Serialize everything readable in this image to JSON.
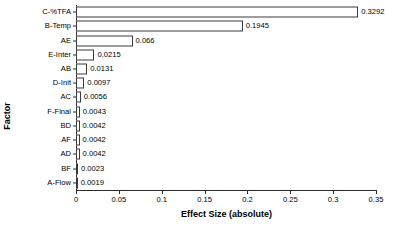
{
  "chart_data": {
    "type": "bar",
    "orientation": "horizontal",
    "title": "",
    "xlabel": "Effect Size (absolute)",
    "ylabel": "Factor",
    "categories": [
      "C-%TFA",
      "B-Temp",
      "AE",
      "E-Inter",
      "AB",
      "D-Init",
      "AC",
      "F-Final",
      "BD",
      "AF",
      "AD",
      "BF",
      "A-Flow"
    ],
    "values": [
      0.3292,
      0.1945,
      0.066,
      0.0215,
      0.0131,
      0.0097,
      0.0056,
      0.0043,
      0.0042,
      0.0042,
      0.0042,
      0.0023,
      0.0019
    ],
    "value_labels": [
      "0.3292",
      "0.1945",
      "0.066",
      "0.0215",
      "0.0131",
      "0.0097",
      "0.0056",
      "0.0043",
      "0.0042",
      "0.0042",
      "0.0042",
      "0.0023",
      "0.0019"
    ],
    "xlim": [
      0,
      0.35
    ],
    "xticks": [
      0,
      0.05,
      0.1,
      0.15,
      0.2,
      0.25,
      0.3,
      0.35
    ],
    "xtick_labels": [
      "0",
      "0.05",
      "0.1",
      "0.15",
      "0.2",
      "0.25",
      "0.3",
      "0.35"
    ],
    "grid": false,
    "legend": null,
    "bar_fill_color": "#ffffff",
    "bar_pattern": "fine-dot-hatch-gray",
    "bar_edge_color": "#3a3a3a",
    "axis_color": "#2b2b2b",
    "background_color": "#ffffff"
  }
}
